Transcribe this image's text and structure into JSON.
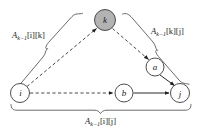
{
  "figure": {
    "type": "directed-graph-diagram",
    "background_color": "#ffffff",
    "title": ""
  },
  "colors": {
    "node_fill_default": "#ffffff",
    "node_fill_highlight": "#b3b3b3",
    "node_stroke": "#3a3a3a",
    "edge_solid": "#2b2b2b",
    "edge_dashed": "#4a4a4a",
    "brace": "#5a5a5a",
    "text": "#1a1a1a"
  },
  "nodes": [
    {
      "id": "k",
      "label": "k",
      "cx": 105,
      "cy": 20,
      "r": 10.5,
      "fill": "#b3b3b3",
      "highlighted": true
    },
    {
      "id": "a",
      "label": "a",
      "cx": 155,
      "cy": 67,
      "r": 9,
      "fill": "#ffffff",
      "highlighted": false
    },
    {
      "id": "i",
      "label": "i",
      "cx": 20,
      "cy": 93,
      "r": 9.5,
      "fill": "#ffffff",
      "highlighted": false
    },
    {
      "id": "b",
      "label": "b",
      "cx": 124,
      "cy": 93,
      "r": 9,
      "fill": "#ffffff",
      "highlighted": false
    },
    {
      "id": "j",
      "label": "j",
      "cx": 180,
      "cy": 93,
      "r": 9.5,
      "fill": "#ffffff",
      "highlighted": false
    }
  ],
  "edges": [
    {
      "id": "i-to-k",
      "from": "i",
      "to": "k",
      "style": "dashed",
      "arrowhead": true
    },
    {
      "id": "k-to-a",
      "from": "k",
      "to": "a",
      "style": "dashed",
      "arrowhead": true
    },
    {
      "id": "a-to-j",
      "from": "a",
      "to": "j",
      "style": "solid",
      "arrowhead": true
    },
    {
      "id": "i-to-b",
      "from": "i",
      "to": "b",
      "style": "dashed",
      "arrowhead": true
    },
    {
      "id": "b-to-j",
      "from": "b",
      "to": "j",
      "style": "solid",
      "arrowhead": true
    }
  ],
  "braces": [
    {
      "id": "brace-i-k",
      "spans": "i-to-k",
      "position": "left",
      "label": {
        "base": "A",
        "subscript": "k−1",
        "indices": "[i][k]",
        "full": "Aₖ₋₁[i][k]"
      }
    },
    {
      "id": "brace-k-j",
      "spans": "k-to-j",
      "position": "right",
      "label": {
        "base": "A",
        "subscript": "k−1",
        "indices": "[k][j]",
        "full": "Aₖ₋₁[k][j]"
      }
    },
    {
      "id": "brace-i-j",
      "spans": "i-to-j",
      "position": "bottom",
      "label": {
        "base": "A",
        "subscript": "k−1",
        "indices": "[i][j]",
        "full": "Aₖ₋₁[i][j]"
      }
    }
  ]
}
